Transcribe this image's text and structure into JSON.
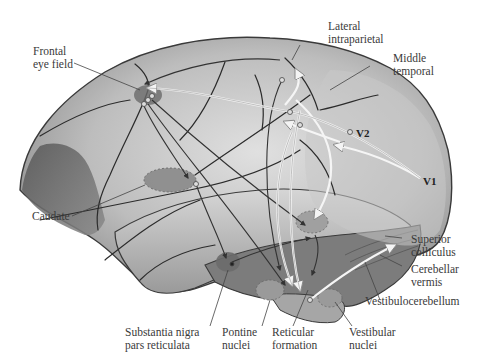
{
  "figure": {
    "colors": {
      "background": "#ffffff",
      "cortex_light": "#d8d8d8",
      "cortex_mid": "#a9a9a9",
      "cortex_dark": "#6e6e6e",
      "sulcus": "#2b2b2b",
      "region_fill": "#7d7d7d",
      "dark_arrow": "#3a3a3a",
      "light_arrow": "#f2f2f2"
    }
  },
  "labels": {
    "frontal_eye_field": [
      "Frontal",
      "eye field"
    ],
    "lateral_intraparietal": [
      "Lateral",
      "intraparietal"
    ],
    "middle_temporal": [
      "Middle",
      "temporal"
    ],
    "v2": "V2",
    "v1": "V1",
    "caudate": "Caudate",
    "superior_colliculus": [
      "Superior",
      "colliculus"
    ],
    "cerebellar_vermis": [
      "Cerebellar",
      "vermis"
    ],
    "vestibulocerebellum": "Vestibulocerebellum",
    "substantia_nigra": [
      "Substantia nigra",
      "pars reticulata"
    ],
    "pontine_nuclei": [
      "Pontine",
      "nuclei"
    ],
    "reticular_formation": [
      "Reticular",
      "formation"
    ],
    "vestibular_nuclei": [
      "Vestibular",
      "nuclei"
    ]
  }
}
